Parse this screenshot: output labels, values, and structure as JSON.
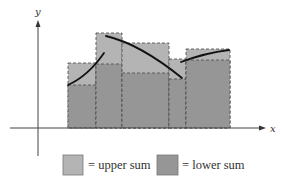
{
  "figure": {
    "type": "riemann-sum-diagram",
    "axes": {
      "x_label": "x",
      "y_label": "y",
      "x_axis_y": 128,
      "y_axis_x": 38
    },
    "colors": {
      "upper_sum": "#b4b4b4",
      "lower_sum": "#969696",
      "curve": "#111111",
      "axis": "#444444",
      "dash": "#555555"
    },
    "intervals": [
      {
        "x0": 68,
        "x1": 96,
        "upper_top": 63,
        "lower_top": 85
      },
      {
        "x0": 96,
        "x1": 122,
        "upper_top": 33,
        "lower_top": 64
      },
      {
        "x0": 122,
        "x1": 169,
        "upper_top": 43,
        "lower_top": 73
      },
      {
        "x0": 169,
        "x1": 186,
        "upper_top": 59,
        "lower_top": 79
      },
      {
        "x0": 186,
        "x1": 230,
        "upper_top": 49,
        "lower_top": 60
      }
    ],
    "curves": [
      {
        "path": "M68,85 Q88,76 104,53"
      },
      {
        "path": "M106,36 Q140,44 182,78"
      },
      {
        "path": "M181,62 Q205,53 229,50"
      }
    ]
  },
  "legend": {
    "items": [
      {
        "label": "= upper sum",
        "swatch": "upper_sum"
      },
      {
        "label": "= lower sum",
        "swatch": "lower_sum"
      }
    ]
  }
}
